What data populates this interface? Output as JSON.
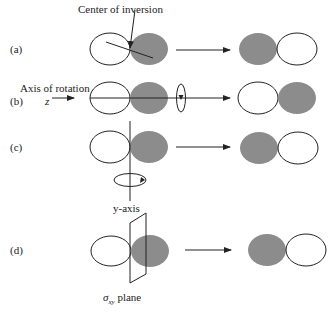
{
  "figure": {
    "rows": [
      {
        "label": "(a)",
        "operation": "inversion",
        "annotation": "Center of inversion"
      },
      {
        "label": "(b)",
        "operation": "rotation about z",
        "annotation": "Axis of rotation",
        "axis": "z"
      },
      {
        "label": "(c)",
        "operation": "rotation about y",
        "annotation": "y-axis"
      },
      {
        "label": "(d)",
        "operation": "reflection",
        "annotation_symbol": "σ",
        "annotation_sub": "xy",
        "annotation_rest": " plane"
      }
    ],
    "colors": {
      "lobe_fill": "#8c8c8c",
      "line": "#222222",
      "background": "#ffffff"
    }
  }
}
